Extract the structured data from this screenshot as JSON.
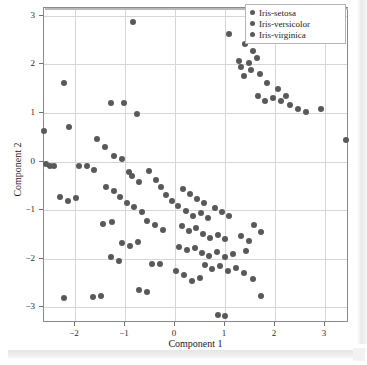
{
  "chart_data": {
    "type": "scatter",
    "title": "",
    "xlabel": "Component 1",
    "ylabel": "Component 2",
    "xlim": [
      -2.62,
      3.48
    ],
    "ylim": [
      -3.32,
      3.16
    ],
    "xticks": [
      -2,
      -1,
      0,
      1,
      2,
      3
    ],
    "yticks": [
      -3,
      -2,
      -1,
      0,
      1,
      2,
      3
    ],
    "grid": true,
    "legend_position": "upper-right",
    "marker_color": "#595959",
    "legend": [
      "Iris-setosa",
      "Iris-versicolor",
      "Iris-virginica"
    ],
    "series": [
      {
        "name": "Iris-setosa",
        "marker_color": "#595959",
        "points": [
          [
            -0.84,
            2.88
          ],
          [
            1.08,
            2.62
          ],
          [
            1.39,
            2.42
          ],
          [
            1.56,
            2.28
          ],
          [
            1.27,
            2.07
          ],
          [
            1.47,
            2.02
          ],
          [
            1.64,
            2.14
          ],
          [
            1.32,
            1.95
          ],
          [
            1.52,
            1.88
          ],
          [
            1.7,
            1.8
          ],
          [
            1.38,
            1.76
          ],
          [
            -2.23,
            1.62
          ],
          [
            -1.28,
            1.2
          ],
          [
            -1.02,
            1.2
          ],
          [
            -0.76,
            0.97
          ],
          [
            1.84,
            1.62
          ],
          [
            2.06,
            1.5
          ],
          [
            2.22,
            1.36
          ],
          [
            1.96,
            1.3
          ],
          [
            2.12,
            1.24
          ],
          [
            1.65,
            1.35
          ],
          [
            1.8,
            1.25
          ],
          [
            2.3,
            1.16
          ],
          [
            2.46,
            1.08
          ],
          [
            2.62,
            1.02
          ],
          [
            2.92,
            1.08
          ],
          [
            3.42,
            0.44
          ]
        ]
      },
      {
        "name": "Iris-versicolor",
        "marker_color": "#595959",
        "points": [
          [
            -2.62,
            0.62
          ],
          [
            -2.58,
            -0.04
          ],
          [
            -2.5,
            -0.1
          ],
          [
            -2.42,
            -0.08
          ],
          [
            -2.12,
            0.72
          ],
          [
            -1.92,
            -0.1
          ],
          [
            -1.76,
            -0.08
          ],
          [
            -1.62,
            -0.18
          ],
          [
            -2.3,
            -0.72
          ],
          [
            -2.14,
            -0.8
          ],
          [
            -1.98,
            -0.74
          ],
          [
            -1.56,
            0.46
          ],
          [
            -1.4,
            0.3
          ],
          [
            -1.22,
            0.12
          ],
          [
            -1.06,
            0.06
          ],
          [
            -0.92,
            -0.22
          ],
          [
            -0.86,
            -0.3
          ],
          [
            -0.72,
            -0.42
          ],
          [
            -1.38,
            -0.52
          ],
          [
            -1.22,
            -0.6
          ],
          [
            -1.1,
            -0.72
          ],
          [
            -0.96,
            -0.86
          ],
          [
            -0.82,
            -0.94
          ],
          [
            -0.66,
            -1.04
          ],
          [
            -0.52,
            -0.2
          ],
          [
            -0.38,
            -0.38
          ],
          [
            -0.28,
            -0.52
          ],
          [
            -0.18,
            -0.68
          ],
          [
            -0.06,
            -0.82
          ],
          [
            0.06,
            -0.92
          ],
          [
            -1.44,
            -1.28
          ],
          [
            -1.26,
            -1.24
          ],
          [
            -0.56,
            -1.22
          ],
          [
            -0.4,
            -1.3
          ],
          [
            -0.24,
            -1.4
          ],
          [
            -1.06,
            -1.68
          ],
          [
            -0.9,
            -1.74
          ],
          [
            -0.74,
            -1.66
          ],
          [
            -1.28,
            -1.96
          ],
          [
            -1.12,
            -2.04
          ],
          [
            -1.64,
            -2.78
          ],
          [
            -1.48,
            -2.76
          ],
          [
            -2.22,
            -2.8
          ]
        ]
      },
      {
        "name": "Iris-virginica",
        "marker_color": "#595959",
        "points": [
          [
            0.16,
            -0.56
          ],
          [
            0.3,
            -0.66
          ],
          [
            0.44,
            -0.76
          ],
          [
            0.58,
            -0.86
          ],
          [
            0.22,
            -1.02
          ],
          [
            0.36,
            -1.12
          ],
          [
            0.52,
            -1.06
          ],
          [
            0.66,
            -1.16
          ],
          [
            0.8,
            -0.96
          ],
          [
            0.94,
            -1.04
          ],
          [
            1.08,
            -1.12
          ],
          [
            0.14,
            -1.32
          ],
          [
            0.28,
            -1.42
          ],
          [
            0.42,
            -1.36
          ],
          [
            0.56,
            -1.48
          ],
          [
            0.7,
            -1.58
          ],
          [
            0.86,
            -1.5
          ],
          [
            1.0,
            -1.6
          ],
          [
            0.08,
            -1.76
          ],
          [
            0.24,
            -1.82
          ],
          [
            0.4,
            -1.78
          ],
          [
            0.54,
            -1.88
          ],
          [
            0.68,
            -1.94
          ],
          [
            0.84,
            -1.86
          ],
          [
            1.0,
            -1.96
          ],
          [
            1.16,
            -1.9
          ],
          [
            1.32,
            -1.52
          ],
          [
            1.48,
            -1.64
          ],
          [
            1.42,
            -1.84
          ],
          [
            1.58,
            -1.3
          ],
          [
            1.72,
            -1.44
          ],
          [
            0.6,
            -2.12
          ],
          [
            0.74,
            -2.2
          ],
          [
            0.9,
            -2.14
          ],
          [
            1.06,
            -2.24
          ],
          [
            1.22,
            -2.18
          ],
          [
            -0.46,
            -2.1
          ],
          [
            -0.3,
            -2.1
          ],
          [
            0.02,
            -2.26
          ],
          [
            0.18,
            -2.34
          ],
          [
            0.34,
            -2.46
          ],
          [
            0.5,
            -2.4
          ],
          [
            1.38,
            -2.3
          ],
          [
            1.56,
            -2.42
          ],
          [
            -0.56,
            -2.68
          ],
          [
            -0.72,
            -2.64
          ],
          [
            1.72,
            -2.76
          ],
          [
            0.86,
            -3.16
          ],
          [
            1.0,
            -3.18
          ]
        ]
      }
    ]
  }
}
